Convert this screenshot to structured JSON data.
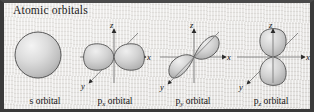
{
  "figure": {
    "title": "Atomic orbitals",
    "background_color": "#e8e6e3",
    "border_color": "#3a3a3a",
    "orbital_fill": "#c8c8c8",
    "orbital_stroke": "#4a4a4a",
    "axis_color": "#6e6e6e"
  },
  "axes": {
    "z_label": "z",
    "x_label": "x",
    "y_label": "y"
  },
  "orbitals": [
    {
      "id": "s",
      "caption_base": "s orbital",
      "caption_prefix": "s",
      "caption_sub": "",
      "caption_suffix": " orbital",
      "shape": "sphere",
      "has_axes": false
    },
    {
      "id": "px",
      "caption_base": "px orbital",
      "caption_prefix": "p",
      "caption_sub": "x",
      "caption_suffix": " orbital",
      "shape": "two-lobes-horizontal",
      "has_axes": true
    },
    {
      "id": "py",
      "caption_base": "py orbital",
      "caption_prefix": "p",
      "caption_sub": "y",
      "caption_suffix": " orbital",
      "shape": "two-lobes-diagonal",
      "has_axes": true
    },
    {
      "id": "pz",
      "caption_base": "pz orbital",
      "caption_prefix": "p",
      "caption_sub": "z",
      "caption_suffix": " orbital",
      "shape": "two-lobes-vertical",
      "has_axes": true
    }
  ]
}
